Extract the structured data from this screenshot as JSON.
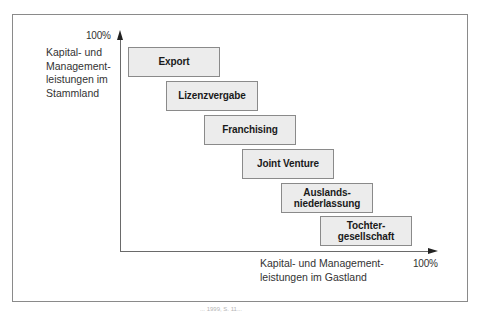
{
  "diagram": {
    "y_axis": {
      "max_label": "100%",
      "title_lines": [
        "Kapital- und",
        "Management-",
        "leistungen im",
        "Stammland"
      ]
    },
    "x_axis": {
      "max_label": "100%",
      "title_lines": [
        "Kapital- und Management-",
        "leistungen im Gastland"
      ]
    },
    "stages": [
      {
        "label": "Export"
      },
      {
        "label": "Lizenzvergabe"
      },
      {
        "label": "Franchising"
      },
      {
        "label": "Joint Venture"
      },
      {
        "label": "Auslands-\nniederlassung"
      },
      {
        "label": "Tochter-\ngesellschaft"
      }
    ],
    "caption": "... 1999, S. 11..."
  },
  "colors": {
    "box_fill": "#ececec",
    "box_border": "#8a8a8a",
    "axis": "#6a6a6a",
    "text": "#1a1a1a"
  }
}
